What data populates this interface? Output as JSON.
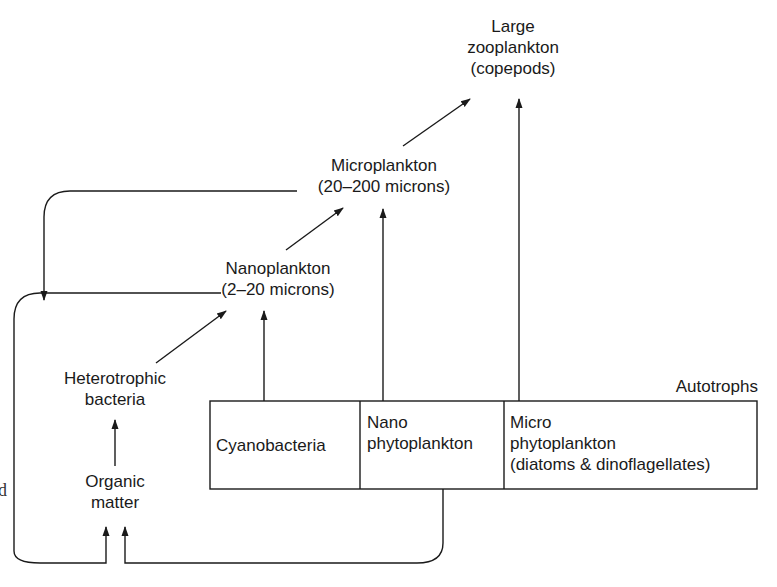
{
  "nodes": {
    "large_zooplankton": {
      "line1": "Large",
      "line2": "zooplankton",
      "line3": "(copepods)"
    },
    "microplankton": {
      "line1": "Microplankton",
      "line2": "(20–200 microns)"
    },
    "nanoplankton": {
      "line1": "Nanoplankton",
      "line2": "(2–20 microns)"
    },
    "heterotrophic_bacteria": {
      "line1": "Heterotrophic",
      "line2": "bacteria"
    },
    "organic_matter": {
      "line1": "Organic",
      "line2": "matter"
    }
  },
  "autotrophs": {
    "title": "Autotrophs",
    "cells": [
      {
        "line1": "Cyanobacteria"
      },
      {
        "line1": "Nano",
        "line2": "phytoplankton"
      },
      {
        "line1": "Micro",
        "line2": "phytoplankton",
        "line3": "(diatoms & dinoflagellates)"
      }
    ]
  },
  "edge_fragment": "d",
  "colors": {
    "line": "#1a1a1a",
    "background": "#ffffff"
  }
}
